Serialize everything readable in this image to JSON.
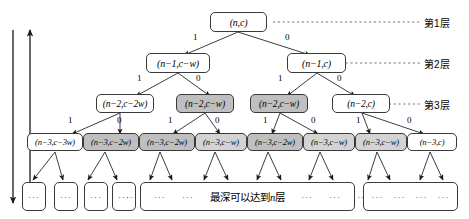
{
  "diagram": {
    "colors": {
      "node_fill": "#ffffff",
      "shaded_fill": "#bfbfbf",
      "stroke": "#3a3a3a"
    },
    "levels": [
      {
        "tag": "第1层"
      },
      {
        "tag": "第2层"
      },
      {
        "tag": "第3层"
      }
    ],
    "direction_labels": [
      {
        "name": "top-down",
        "text": "自顶向下",
        "arrow": "down"
      },
      {
        "name": "bottom-up",
        "text": "自底向上",
        "arrow": "up"
      }
    ],
    "nodes": {
      "level1": [
        {
          "label": "(n,c)",
          "shaded": false
        }
      ],
      "level2": [
        {
          "label": "(n−1,c−w)",
          "shaded": false
        },
        {
          "label": "(n−1,c)",
          "shaded": false
        }
      ],
      "level3": [
        {
          "label": "(n−2,c−2w)",
          "shaded": false
        },
        {
          "label": "(n−2,c−w)",
          "shaded": true
        },
        {
          "label": "(n−2,c−w)",
          "shaded": true
        },
        {
          "label": "(n−2,c)",
          "shaded": false
        }
      ],
      "level4": [
        {
          "label": "(n−3,c−3w)",
          "shaded": false
        },
        {
          "label": "(n−3,c−2w)",
          "shaded": true
        },
        {
          "label": "(n−3,c−2w)",
          "shaded": true
        },
        {
          "label": "(n−3,c−w)",
          "shaded": false
        },
        {
          "label": "(n−3,c−2w)",
          "shaded": true
        },
        {
          "label": "(n−3,c−w)",
          "shaded": false
        },
        {
          "label": "(n−3,c−w)",
          "shaded": true
        },
        {
          "label": "(n−3,c)",
          "shaded": false
        }
      ]
    },
    "edge_labels": {
      "left": "1",
      "right": "0"
    },
    "bottom": {
      "small_boxes": [
        {
          "text": "···"
        },
        {
          "text": "···"
        },
        {
          "text": "···"
        },
        {
          "text": "···"
        }
      ],
      "wide_box": {
        "left_dots": [
          "···",
          "···",
          "···"
        ],
        "caption_prefix": "最深可以达到",
        "caption_var": "n",
        "caption_suffix": "层",
        "right_dots": [
          "···",
          "···",
          "···"
        ]
      },
      "right_box": {
        "dots": [
          "···",
          "···",
          "···",
          "···"
        ]
      }
    }
  }
}
